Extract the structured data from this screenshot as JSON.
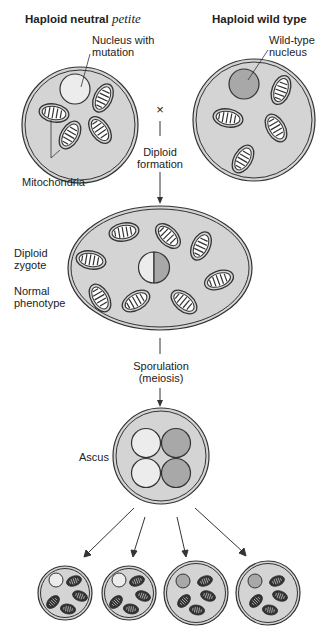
{
  "headers": {
    "left_prefix": "Haploid neutral ",
    "left_italic": "petite",
    "right": "Haploid wild type"
  },
  "labels": {
    "nucleus_mutation_1": "Nucleus with",
    "nucleus_mutation_2": "mutation",
    "wildtype_nucleus_1": "Wild-type",
    "wildtype_nucleus_2": "nucleus",
    "cross": "×",
    "mitochondria": "Mitochondria",
    "diploid_formation_1": "Diploid",
    "diploid_formation_2": "formation",
    "diploid_zygote_1": "Diploid",
    "diploid_zygote_2": "zygote",
    "normal_phenotype_1": "Normal",
    "normal_phenotype_2": "phenotype",
    "sporulation_1": "Sporulation",
    "sporulation_2": "(meiosis)",
    "ascus": "Ascus"
  },
  "colors": {
    "cell": "#d4d4d4",
    "mutant_nucleus": "#ececec",
    "wt_nucleus": "#a8a8a8",
    "stroke": "#333333"
  }
}
